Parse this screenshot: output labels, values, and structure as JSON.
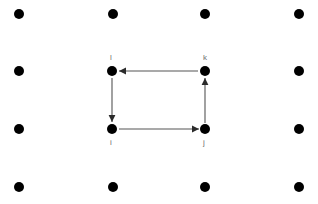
{
  "figure": {
    "type": "directed-graph-on-lattice",
    "canvas": {
      "width": 318,
      "height": 204,
      "background": "#ffffff"
    },
    "colors": {
      "dot": "#000000",
      "node": "#000000",
      "edge": "#555555",
      "arrow": "#2b2b2b",
      "label": "#6f6f6f"
    },
    "lattice": {
      "columns_x": [
        19,
        113,
        205,
        299
      ],
      "rows_y": [
        14,
        71,
        129,
        187
      ],
      "dot_radius": 5,
      "dot_count": 16
    },
    "nodes": [
      {
        "id": "l",
        "label": "l",
        "x": 112,
        "y": 71,
        "radius": 5,
        "label_x": 110,
        "label_y": 53
      },
      {
        "id": "k",
        "label": "k",
        "x": 205,
        "y": 71,
        "radius": 5,
        "label_x": 203,
        "label_y": 53
      },
      {
        "id": "i",
        "label": "i",
        "x": 112,
        "y": 129,
        "radius": 5,
        "label_x": 110,
        "label_y": 138
      },
      {
        "id": "j",
        "label": "j",
        "x": 205,
        "y": 129,
        "radius": 5,
        "label_x": 203,
        "label_y": 138
      }
    ],
    "edges": [
      {
        "id": "i-to-j",
        "from": "i",
        "to": "j",
        "direction": "right",
        "line": "119,129 199,129",
        "arrow": "199,129 192,125.6 192,132.4"
      },
      {
        "id": "j-to-k",
        "from": "j",
        "to": "k",
        "direction": "up",
        "line": "205,123 205,78",
        "arrow": "205,78 201.6,85 208.4,85"
      },
      {
        "id": "k-to-l",
        "from": "k",
        "to": "l",
        "direction": "left",
        "line": "198,71 119,71",
        "arrow": "119,71 126,67.6 126,74.4"
      },
      {
        "id": "l-to-i",
        "from": "l",
        "to": "i",
        "direction": "down",
        "line": "112,78 112,122",
        "arrow": "112,122 108.6,115 115.4,115"
      }
    ],
    "cycle_order": [
      "i",
      "j",
      "k",
      "l"
    ]
  }
}
